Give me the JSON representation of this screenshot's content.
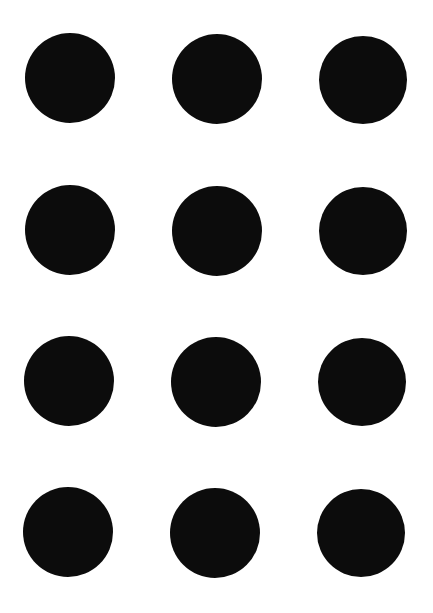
{
  "background": "#ffffff",
  "dot_color": "#0c0c0c",
  "grid": {
    "rows": 4,
    "cols": 3
  },
  "dots": [
    {
      "row": 1,
      "col": 1,
      "cx": 70,
      "cy": 78,
      "r": 45
    },
    {
      "row": 1,
      "col": 2,
      "cx": 217,
      "cy": 79,
      "r": 45
    },
    {
      "row": 1,
      "col": 3,
      "cx": 363,
      "cy": 80,
      "r": 44
    },
    {
      "row": 2,
      "col": 1,
      "cx": 70,
      "cy": 230,
      "r": 45
    },
    {
      "row": 2,
      "col": 2,
      "cx": 217,
      "cy": 231,
      "r": 45
    },
    {
      "row": 2,
      "col": 3,
      "cx": 363,
      "cy": 231,
      "r": 44
    },
    {
      "row": 3,
      "col": 1,
      "cx": 69,
      "cy": 381,
      "r": 45
    },
    {
      "row": 3,
      "col": 2,
      "cx": 216,
      "cy": 382,
      "r": 45
    },
    {
      "row": 3,
      "col": 3,
      "cx": 362,
      "cy": 382,
      "r": 44
    },
    {
      "row": 4,
      "col": 1,
      "cx": 68,
      "cy": 532,
      "r": 45
    },
    {
      "row": 4,
      "col": 2,
      "cx": 215,
      "cy": 533,
      "r": 45
    },
    {
      "row": 4,
      "col": 3,
      "cx": 361,
      "cy": 533,
      "r": 44
    }
  ]
}
